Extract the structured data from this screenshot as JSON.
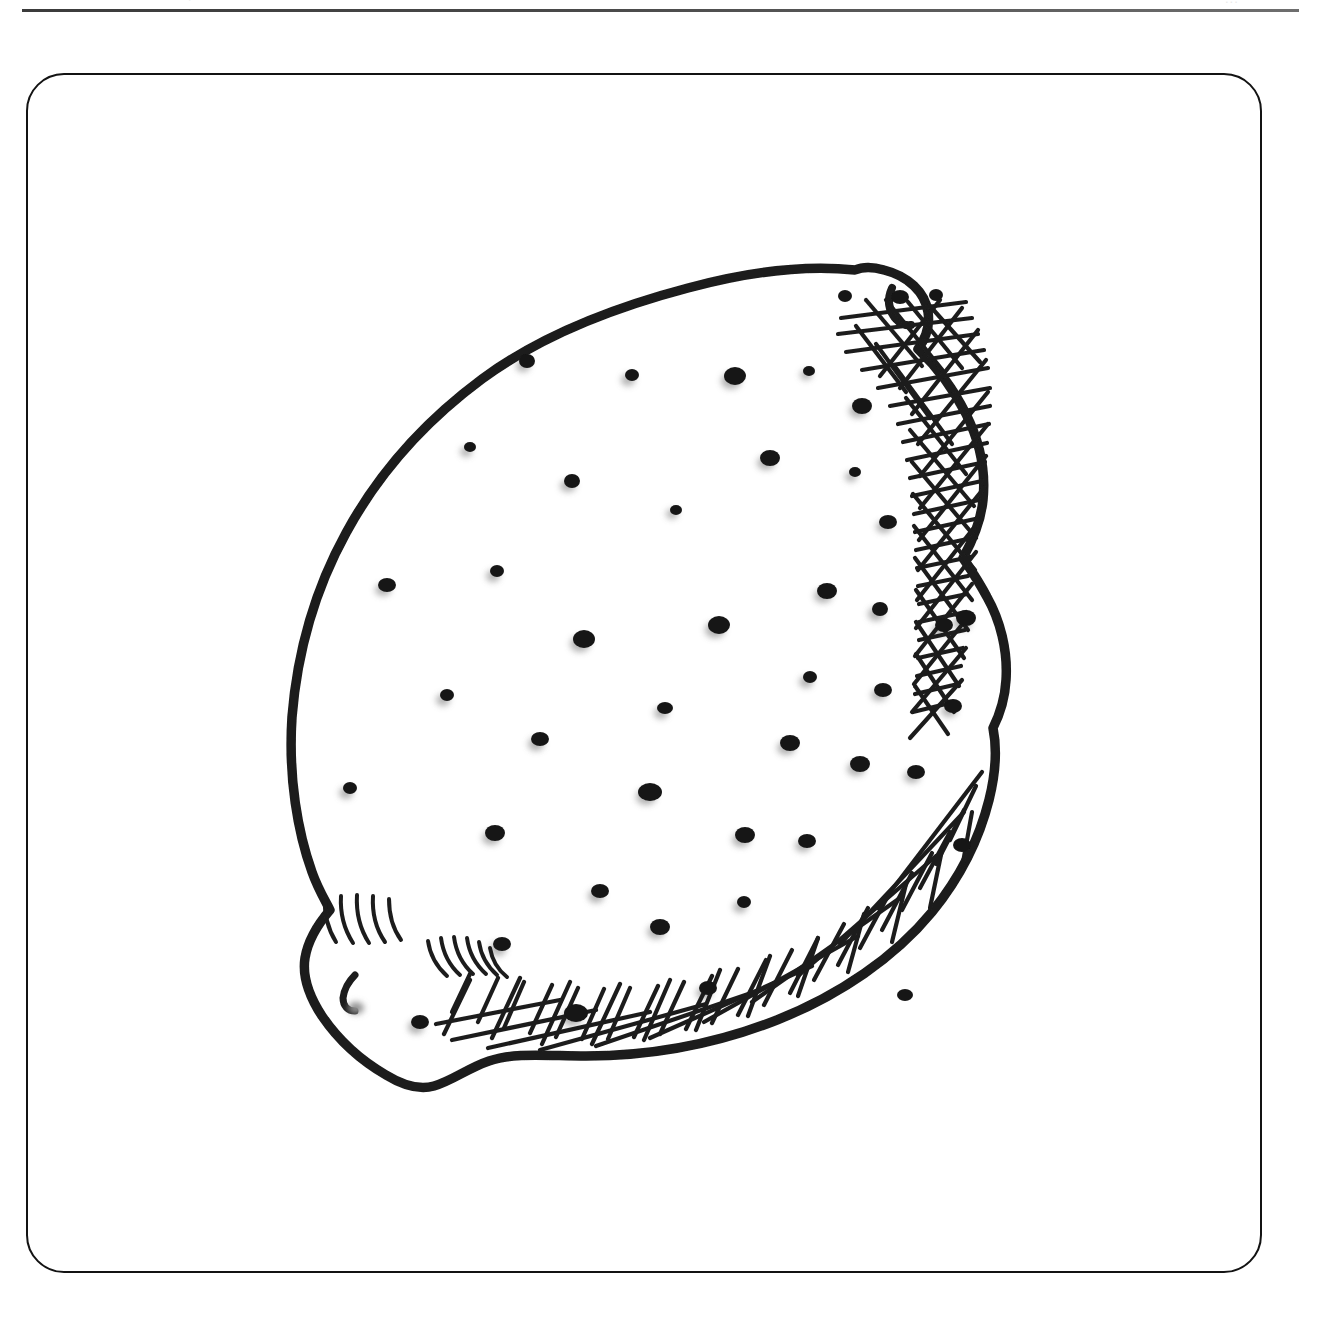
{
  "page": {
    "width": 1330,
    "height": 1341,
    "background_color": "#ffffff",
    "ink_color": "#1b1b1b",
    "shadow_color": "#9a9a9a"
  },
  "header": {
    "rule_color": "#3b3b3b",
    "cropped_text_right": "...",
    "cropped_text_left": "."
  },
  "frame": {
    "border_color": "#131313",
    "corner_radius": 38,
    "border_width": 2.4
  },
  "artwork": {
    "title": "Lemon",
    "subject": "lemon",
    "style": "hand-drawn ink line illustration",
    "technique": "pen and ink, crosshatch shading, stippled peel pores",
    "orientation": "tilted diagonally, stem nub upper-right and lower-left",
    "bounding_box": {
      "x": 288,
      "y": 256,
      "width": 720,
      "height": 838
    },
    "outline_stroke_width": 9,
    "features": [
      {
        "name": "peel-outline",
        "description": "closed irregular lemon silhouette"
      },
      {
        "name": "stem-nub-top-right",
        "description": "small pointed nipple at upper right"
      },
      {
        "name": "stem-nub-bottom-left",
        "description": "blunt stem end at lower left"
      },
      {
        "name": "crosshatch-shading-right",
        "description": "dense crosshatch along right edge"
      },
      {
        "name": "crosshatch-shading-bottom",
        "description": "dense crosshatch along bottom edge"
      },
      {
        "name": "curved-hatch-marks",
        "description": "two arcs of short curved hatch strokes near the lower-left nub"
      },
      {
        "name": "peel-pores",
        "description": "scattered ink dots representing oil glands"
      },
      {
        "name": "stem-scar-mark",
        "description": "small hooked ink mark at lower-left nub"
      }
    ],
    "pore_count": 52,
    "pore_size_range_px": [
      6,
      20
    ]
  }
}
